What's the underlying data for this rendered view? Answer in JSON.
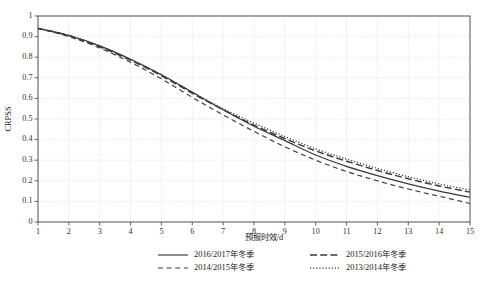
{
  "chart_data": {
    "type": "line",
    "title": "",
    "xlabel": "预报时效/d",
    "ylabel": "CRPSS",
    "xlim": [
      1,
      15
    ],
    "ylim": [
      0,
      1
    ],
    "grid": true,
    "legend_position": "bottom",
    "x": [
      1,
      2,
      3,
      4,
      5,
      6,
      7,
      8,
      9,
      10,
      11,
      12,
      13,
      14,
      15
    ],
    "xticks": [
      "1",
      "2",
      "3",
      "4",
      "5",
      "6",
      "7",
      "8",
      "9",
      "10",
      "11",
      "12",
      "13",
      "14",
      "15"
    ],
    "yticks": [
      "0",
      "0.1",
      "0.2",
      "0.3",
      "0.4",
      "0.5",
      "0.6",
      "0.7",
      "0.8",
      "0.9",
      "1"
    ],
    "series": [
      {
        "name": "2016/2017年冬季",
        "style": "solid",
        "color": "#3a3a3a",
        "values": [
          0.94,
          0.905,
          0.855,
          0.79,
          0.715,
          0.63,
          0.545,
          0.465,
          0.395,
          0.325,
          0.27,
          0.225,
          0.185,
          0.15,
          0.12
        ]
      },
      {
        "name": "2015/2016年冬季",
        "style": "long-dash",
        "color": "#3a3a3a",
        "values": [
          0.94,
          0.905,
          0.85,
          0.785,
          0.71,
          0.625,
          0.545,
          0.47,
          0.405,
          0.345,
          0.295,
          0.25,
          0.21,
          0.175,
          0.145
        ]
      },
      {
        "name": "2014/2015年冬季",
        "style": "dash",
        "color": "#3a3a3a",
        "values": [
          0.94,
          0.9,
          0.845,
          0.775,
          0.695,
          0.605,
          0.52,
          0.44,
          0.365,
          0.3,
          0.245,
          0.2,
          0.16,
          0.125,
          0.09
        ]
      },
      {
        "name": "2013/2014年冬季",
        "style": "dot",
        "color": "#3a3a3a",
        "values": [
          0.94,
          0.905,
          0.855,
          0.79,
          0.715,
          0.63,
          0.55,
          0.48,
          0.415,
          0.355,
          0.305,
          0.26,
          0.22,
          0.185,
          0.155
        ]
      }
    ]
  },
  "legend": {
    "entries": [
      {
        "label": "2016/2017年冬季",
        "style": "solid"
      },
      {
        "label": "2015/2016年冬季",
        "style": "long-dash"
      },
      {
        "label": "2014/2015年冬季",
        "style": "dash"
      },
      {
        "label": "2013/2014年冬季",
        "style": "dot"
      }
    ]
  }
}
